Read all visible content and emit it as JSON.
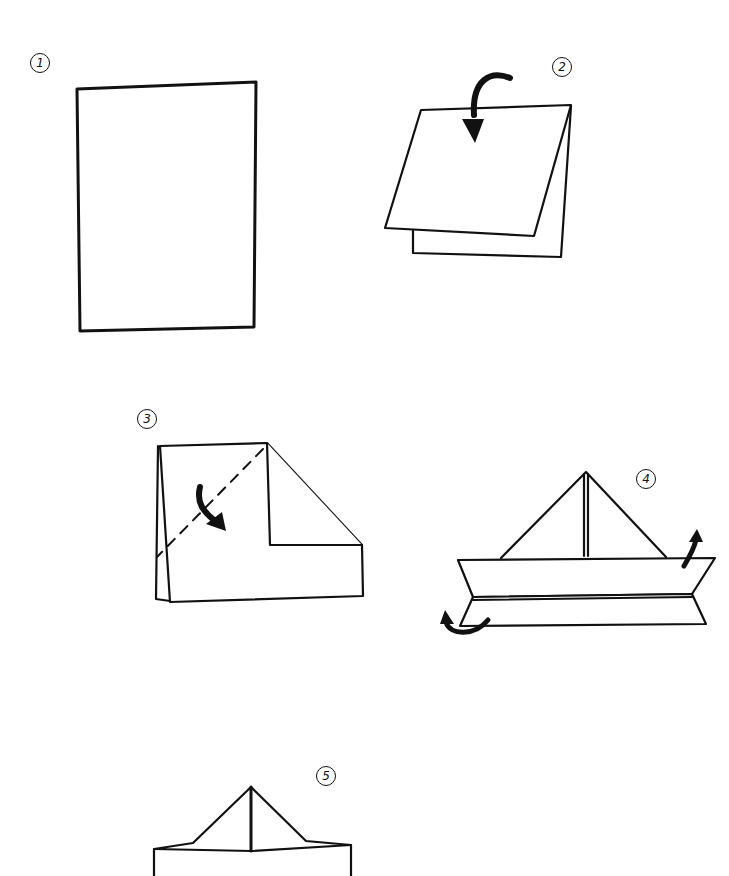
{
  "title_fragment": "",
  "diagram": {
    "type": "paper-boat-folding-instructions",
    "steps": [
      {
        "number": "1",
        "label": "①",
        "description": "Rectangular sheet of paper"
      },
      {
        "number": "2",
        "label": "②",
        "description": "Fold the sheet in half from top down"
      },
      {
        "number": "3",
        "label": "③",
        "description": "Fold corners down diagonally along dashed line"
      },
      {
        "number": "4",
        "label": "④",
        "description": "Fold bottom edges up on both sides"
      },
      {
        "number": "5",
        "label": "⑤",
        "description": "Open out the shape"
      }
    ],
    "colors": {
      "ink": "#111111",
      "paper": "#ffffff"
    }
  }
}
